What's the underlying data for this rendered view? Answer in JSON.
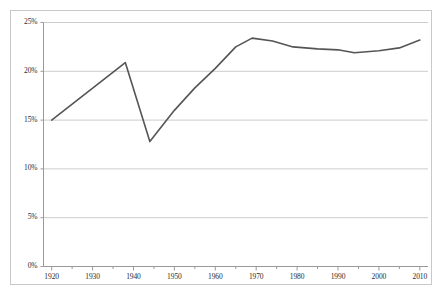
{
  "chart_data": {
    "type": "line",
    "title": "",
    "subtitle": "",
    "xlabel": "",
    "ylabel": "",
    "xlim": [
      1918,
      2012
    ],
    "ylim": [
      0,
      25
    ],
    "grid": true,
    "legend": null,
    "legend_position": "none",
    "line_color": "#555555",
    "gridline_color": "#cccccc",
    "axis_color": "#999999",
    "frame_color": "#c9c9c9",
    "y_ticks": [
      0,
      5,
      10,
      15,
      20,
      25
    ],
    "y_tick_labels": [
      "0%",
      "5%",
      "10%",
      "15%",
      "20%",
      "25%"
    ],
    "x_ticks": [
      1920,
      1930,
      1940,
      1950,
      1960,
      1970,
      1980,
      1990,
      2000,
      2010
    ],
    "x_tick_labels": [
      "1920",
      "1930",
      "1940",
      "1950",
      "1960",
      "1970",
      "1980",
      "1990",
      "2000",
      "2010"
    ],
    "x_minor_ticks": [
      1925,
      1935,
      1945,
      1955,
      1965,
      1975,
      1985,
      1995,
      2005
    ],
    "series": [
      {
        "name": "series-1",
        "x": [
          1920,
          1938,
          1944,
          1950,
          1955,
          1960,
          1965,
          1969,
          1974,
          1979,
          1985,
          1990,
          1994,
          2000,
          2005,
          2010
        ],
        "values": [
          15.0,
          20.9,
          12.8,
          16.0,
          18.3,
          20.3,
          22.5,
          23.4,
          23.1,
          22.5,
          22.3,
          22.2,
          21.9,
          22.1,
          22.4,
          23.2
        ]
      }
    ]
  }
}
